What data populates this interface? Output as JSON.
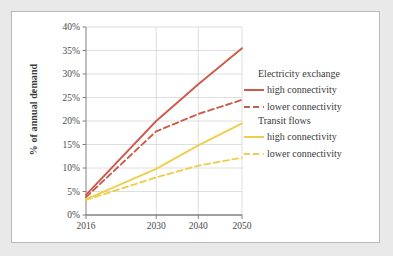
{
  "chart_data": {
    "type": "line",
    "title": "",
    "xlabel": "",
    "ylabel": "% of annual demand",
    "x": [
      "2016",
      "2030",
      "2040",
      "2050"
    ],
    "x_positions": [
      0.0,
      0.45,
      0.72,
      1.0
    ],
    "ylim": [
      0,
      40
    ],
    "ytick_labels": [
      "0%",
      "5%",
      "10%",
      "15%",
      "20%",
      "25%",
      "30%",
      "35%",
      "40%"
    ],
    "ytick_values": [
      0,
      5,
      10,
      15,
      20,
      25,
      30,
      35,
      40
    ],
    "grid": true,
    "legend_position": "right",
    "series": [
      {
        "name": "Electricity exchange - high connectivity",
        "group": "Electricity exchange",
        "label": "high connectivity",
        "style": "solid",
        "color": "#CC5B4C",
        "values": [
          4.3,
          20.0,
          27.8,
          35.5
        ]
      },
      {
        "name": "Electricity exchange - lower connectivity",
        "group": "Electricity exchange",
        "label": "lower connectivity",
        "style": "dashed",
        "color": "#CC5B4C",
        "values": [
          3.8,
          17.8,
          21.5,
          24.5
        ]
      },
      {
        "name": "Transit flows - high connectivity",
        "group": "Transit flows",
        "label": "high connectivity",
        "style": "solid",
        "color": "#EECF4D",
        "values": [
          3.3,
          9.8,
          14.8,
          19.5
        ]
      },
      {
        "name": "Transit flows - lower connectivity",
        "group": "Transit flows",
        "label": "lower connectivity",
        "style": "dashed",
        "color": "#EECF4D",
        "values": [
          3.2,
          8.0,
          10.5,
          12.2
        ]
      }
    ]
  },
  "legend": {
    "groups": [
      {
        "header": "Electricity exchange",
        "entries": [
          {
            "label": "high connectivity",
            "color": "#CC5B4C",
            "style": "solid"
          },
          {
            "label": "lower connectivity",
            "color": "#CC5B4C",
            "style": "dashed"
          }
        ]
      },
      {
        "header": "Transit flows",
        "entries": [
          {
            "label": "high connectivity",
            "color": "#EECF4D",
            "style": "solid"
          },
          {
            "label": "lower connectivity",
            "color": "#EECF4D",
            "style": "dashed"
          }
        ]
      }
    ]
  },
  "colors": {
    "electricity_exchange": "#CC5B4C",
    "transit_flows": "#EECF4D",
    "grid": "#d6d6d6",
    "axis": "#808080",
    "text": "#3a3a3a",
    "page_background": "#e9e9e9",
    "card_background": "#ffffff"
  }
}
